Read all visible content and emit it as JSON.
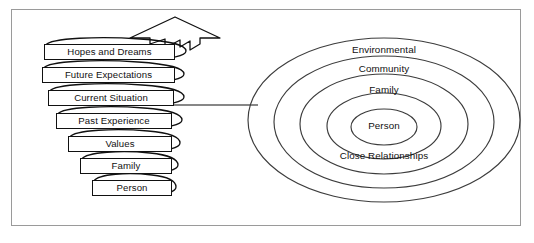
{
  "figure": {
    "frame_border_color": "#9a9a9a",
    "line_color": "#111111",
    "background": "#ffffff"
  },
  "spiral": {
    "name": "developmental-spiral",
    "direction_arrow": "up-arrow",
    "levels": [
      {
        "label": "Hopes and Dreams"
      },
      {
        "label": "Future Expectations"
      },
      {
        "label": "Current Situation"
      },
      {
        "label": "Past Experience"
      },
      {
        "label": "Values"
      },
      {
        "label": "Family"
      },
      {
        "label": "Person"
      }
    ]
  },
  "connector": {
    "name": "spiral-to-circles-connector",
    "style": "horizontal-line"
  },
  "circles": {
    "name": "concentric-context-circles",
    "rings": [
      {
        "label": "Environmental",
        "level": 1
      },
      {
        "label": "Community",
        "level": 2
      },
      {
        "label": "Family",
        "level": 3
      },
      {
        "label": "Close Relationships",
        "level": 4
      },
      {
        "label": "Person",
        "level": 5
      }
    ]
  }
}
